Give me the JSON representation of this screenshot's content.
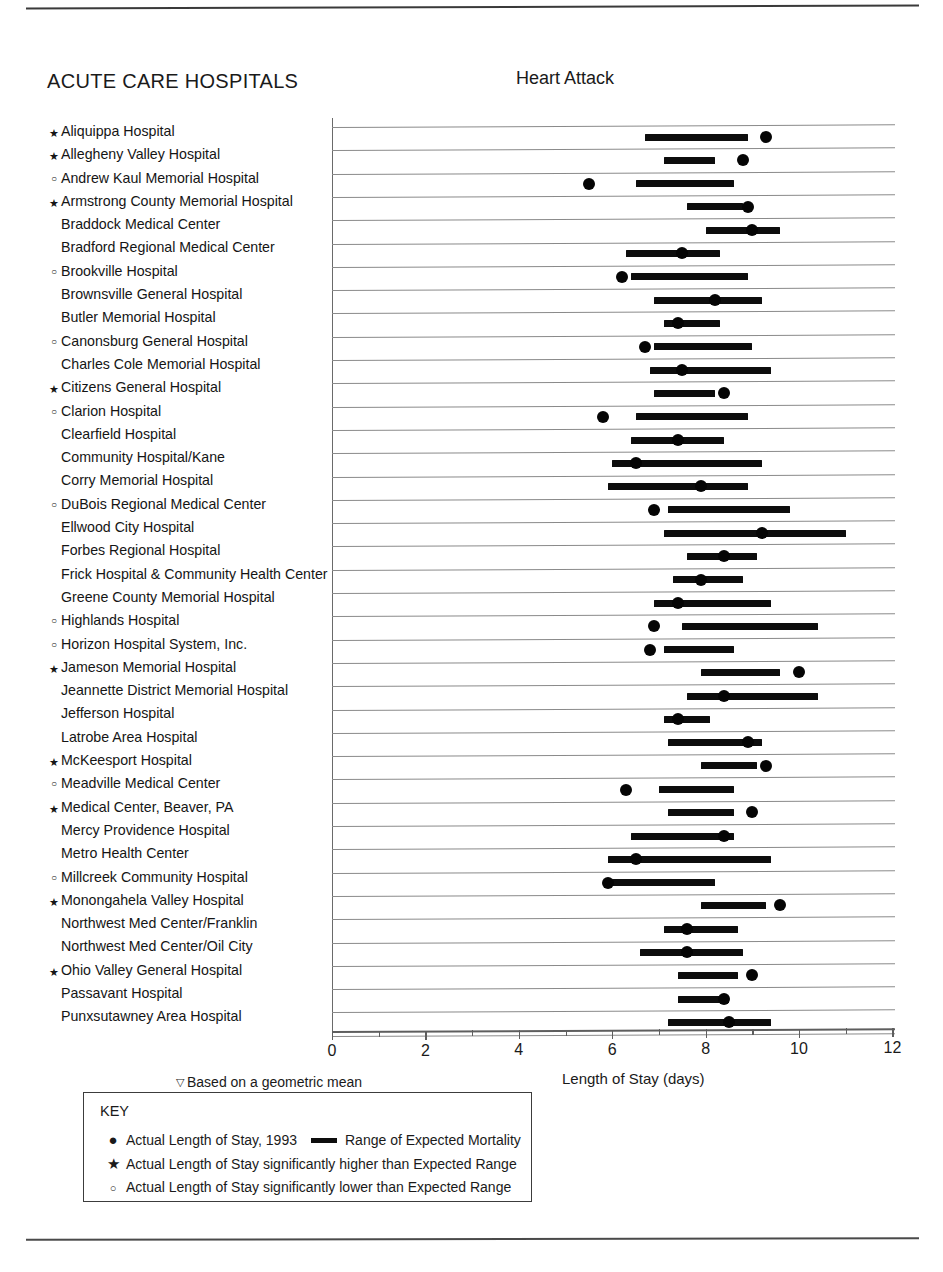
{
  "header": {
    "section_title": "ACUTE CARE HOSPITALS",
    "chart_title": "Heart Attack"
  },
  "axis": {
    "x_caption": "Length of Stay (days)",
    "footnote": "Based on a geometric mean",
    "footnote_symbol": "▽",
    "ticks": [
      "0",
      "2",
      "4",
      "6",
      "8",
      "10",
      "12"
    ]
  },
  "key": {
    "title": "KEY",
    "rows": [
      {
        "symbol": "●",
        "symbol_name": "filled-dot",
        "label": "Actual Length of Stay, 1993",
        "extra_label": "Range of Expected Mortality"
      },
      {
        "symbol": "★",
        "symbol_name": "star",
        "label": "Actual Length of Stay significantly higher than Expected Range"
      },
      {
        "symbol": "○",
        "symbol_name": "open-circle",
        "label": "Actual Length of Stay  significantly lower than Expected Range"
      }
    ]
  },
  "chart_data": {
    "type": "range-dot-plot",
    "title": "Heart Attack",
    "xlabel": "Length of Stay (days)",
    "ylabel": "",
    "xlim": [
      0,
      12
    ],
    "xticks": [
      0,
      2,
      4,
      6,
      8,
      10,
      12
    ],
    "grid": true,
    "legend_position": "below",
    "series": [
      {
        "name": "Range of Expected Mortality",
        "type": "range-bar"
      },
      {
        "name": "Actual Length of Stay, 1993",
        "type": "dot"
      }
    ],
    "categories": [
      "Aliquippa Hospital",
      "Allegheny Valley Hospital",
      "Andrew Kaul Memorial Hospital",
      "Armstrong County Memorial Hospital",
      "Braddock Medical Center",
      "Bradford Regional Medical Center",
      "Brookville Hospital",
      "Brownsville General Hospital",
      "Butler Memorial Hospital",
      "Canonsburg General Hospital",
      "Charles Cole Memorial Hospital",
      "Citizens General Hospital",
      "Clarion Hospital",
      "Clearfield Hospital",
      "Community Hospital/Kane",
      "Corry Memorial Hospital",
      "DuBois Regional Medical Center",
      "Ellwood City Hospital",
      "Forbes Regional Hospital",
      "Frick Hospital & Community Health Center",
      "Greene County Memorial Hospital",
      "Highlands Hospital",
      "Horizon Hospital System, Inc.",
      "Jameson Memorial Hospital",
      "Jeannette District Memorial Hospital",
      "Jefferson Hospital",
      "Latrobe Area Hospital",
      "McKeesport Hospital",
      "Meadville Medical Center",
      "Medical Center, Beaver, PA",
      "Mercy Providence Hospital",
      "Metro Health Center",
      "Millcreek Community Hospital",
      "Monongahela Valley Hospital",
      "Northwest Med Center/Franklin",
      "Northwest Med Center/Oil City",
      "Ohio Valley General Hospital",
      "Passavant Hospital",
      "Punxsutawney Area Hospital"
    ],
    "rows": [
      {
        "name": "Aliquippa Hospital",
        "marker": "star",
        "range_low": 6.7,
        "range_high": 8.9,
        "actual": 9.3
      },
      {
        "name": "Allegheny Valley Hospital",
        "marker": "star",
        "range_low": 7.1,
        "range_high": 8.2,
        "actual": 8.8
      },
      {
        "name": "Andrew Kaul Memorial Hospital",
        "marker": "circle",
        "range_low": 6.5,
        "range_high": 8.6,
        "actual": 5.5
      },
      {
        "name": "Armstrong County Memorial Hospital",
        "marker": "star",
        "range_low": 7.6,
        "range_high": 8.8,
        "actual": 8.9
      },
      {
        "name": "Braddock Medical Center",
        "marker": "none",
        "range_low": 8.0,
        "range_high": 9.6,
        "actual": 9.0
      },
      {
        "name": "Bradford Regional Medical Center",
        "marker": "none",
        "range_low": 6.3,
        "range_high": 8.3,
        "actual": 7.5
      },
      {
        "name": "Brookville Hospital",
        "marker": "circle",
        "range_low": 6.4,
        "range_high": 8.9,
        "actual": 6.2
      },
      {
        "name": "Brownsville General Hospital",
        "marker": "none",
        "range_low": 6.9,
        "range_high": 9.2,
        "actual": 8.2
      },
      {
        "name": "Butler Memorial Hospital",
        "marker": "none",
        "range_low": 7.1,
        "range_high": 8.3,
        "actual": 7.4
      },
      {
        "name": "Canonsburg General Hospital",
        "marker": "circle",
        "range_low": 6.9,
        "range_high": 9.0,
        "actual": 6.7
      },
      {
        "name": "Charles Cole Memorial Hospital",
        "marker": "none",
        "range_low": 6.8,
        "range_high": 9.4,
        "actual": 7.5
      },
      {
        "name": "Citizens General Hospital",
        "marker": "star",
        "range_low": 6.9,
        "range_high": 8.2,
        "actual": 8.4
      },
      {
        "name": "Clarion Hospital",
        "marker": "circle",
        "range_low": 6.5,
        "range_high": 8.9,
        "actual": 5.8
      },
      {
        "name": "Clearfield Hospital",
        "marker": "none",
        "range_low": 6.4,
        "range_high": 8.4,
        "actual": 7.4
      },
      {
        "name": "Community Hospital/Kane",
        "marker": "none",
        "range_low": 6.0,
        "range_high": 9.2,
        "actual": 6.5
      },
      {
        "name": "Corry Memorial Hospital",
        "marker": "none",
        "range_low": 5.9,
        "range_high": 8.9,
        "actual": 7.9
      },
      {
        "name": "DuBois Regional Medical Center",
        "marker": "circle",
        "range_low": 7.2,
        "range_high": 9.8,
        "actual": 6.9
      },
      {
        "name": "Ellwood City Hospital",
        "marker": "none",
        "range_low": 7.1,
        "range_high": 11.0,
        "actual": 9.2
      },
      {
        "name": "Forbes Regional Hospital",
        "marker": "none",
        "range_low": 7.6,
        "range_high": 9.1,
        "actual": 8.4
      },
      {
        "name": "Frick Hospital & Community Health Center",
        "marker": "none",
        "range_low": 7.3,
        "range_high": 8.8,
        "actual": 7.9
      },
      {
        "name": "Greene County Memorial Hospital",
        "marker": "none",
        "range_low": 6.9,
        "range_high": 9.4,
        "actual": 7.4
      },
      {
        "name": "Highlands Hospital",
        "marker": "circle",
        "range_low": 7.5,
        "range_high": 10.4,
        "actual": 6.9
      },
      {
        "name": "Horizon Hospital System, Inc.",
        "marker": "circle",
        "range_low": 7.1,
        "range_high": 8.6,
        "actual": 6.8
      },
      {
        "name": "Jameson Memorial Hospital",
        "marker": "star",
        "range_low": 7.9,
        "range_high": 9.6,
        "actual": 10.0
      },
      {
        "name": "Jeannette District Memorial Hospital",
        "marker": "none",
        "range_low": 7.6,
        "range_high": 10.4,
        "actual": 8.4
      },
      {
        "name": "Jefferson Hospital",
        "marker": "none",
        "range_low": 7.1,
        "range_high": 8.1,
        "actual": 7.4
      },
      {
        "name": "Latrobe Area Hospital",
        "marker": "none",
        "range_low": 7.2,
        "range_high": 9.2,
        "actual": 8.9
      },
      {
        "name": "McKeesport Hospital",
        "marker": "star",
        "range_low": 7.9,
        "range_high": 9.1,
        "actual": 9.3
      },
      {
        "name": "Meadville Medical Center",
        "marker": "circle",
        "range_low": 7.0,
        "range_high": 8.6,
        "actual": 6.3
      },
      {
        "name": "Medical Center, Beaver, PA",
        "marker": "star",
        "range_low": 7.2,
        "range_high": 8.6,
        "actual": 9.0
      },
      {
        "name": "Mercy Providence Hospital",
        "marker": "none",
        "range_low": 6.4,
        "range_high": 8.6,
        "actual": 8.4
      },
      {
        "name": "Metro Health Center",
        "marker": "none",
        "range_low": 5.9,
        "range_high": 9.4,
        "actual": 6.5
      },
      {
        "name": "Millcreek Community Hospital",
        "marker": "circle",
        "range_low": 6.0,
        "range_high": 8.2,
        "actual": 5.9
      },
      {
        "name": "Monongahela Valley Hospital",
        "marker": "star",
        "range_low": 7.9,
        "range_high": 9.3,
        "actual": 9.6
      },
      {
        "name": "Northwest Med Center/Franklin",
        "marker": "none",
        "range_low": 7.1,
        "range_high": 8.7,
        "actual": 7.6
      },
      {
        "name": "Northwest Med Center/Oil City",
        "marker": "none",
        "range_low": 6.6,
        "range_high": 8.8,
        "actual": 7.6
      },
      {
        "name": "Ohio Valley General Hospital",
        "marker": "star",
        "range_low": 7.4,
        "range_high": 8.7,
        "actual": 9.0
      },
      {
        "name": "Passavant Hospital",
        "marker": "none",
        "range_low": 7.4,
        "range_high": 8.5,
        "actual": 8.4
      },
      {
        "name": "Punxsutawney Area Hospital",
        "marker": "none",
        "range_low": 7.2,
        "range_high": 9.4,
        "actual": 8.5
      }
    ]
  }
}
